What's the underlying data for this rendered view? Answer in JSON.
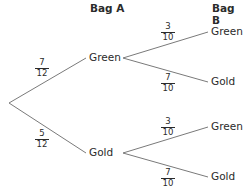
{
  "headers": {
    "bag_a": "Bag A",
    "bag_b": "Bag B"
  },
  "branches": {
    "a_green": {
      "label": "Green",
      "prob": {
        "num": "7",
        "den": "12"
      }
    },
    "a_gold": {
      "label": "Gold",
      "prob": {
        "num": "5",
        "den": "12"
      }
    },
    "green_green": {
      "label": "Green",
      "prob": {
        "num": "3",
        "den": "10"
      }
    },
    "green_gold": {
      "label": "Gold",
      "prob": {
        "num": "7",
        "den": "10"
      }
    },
    "gold_green": {
      "label": "Green",
      "prob": {
        "num": "3",
        "den": "10"
      }
    },
    "gold_gold": {
      "label": "Gold",
      "prob": {
        "num": "7",
        "den": "10"
      }
    }
  },
  "colors": {
    "line": "#7a7a7a",
    "text": "#2b2b2b"
  }
}
